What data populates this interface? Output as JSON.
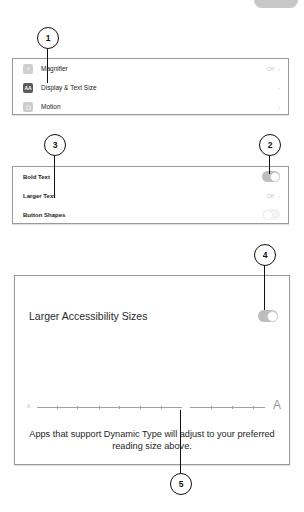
{
  "accessibility_list": {
    "items": [
      {
        "icon": "magnifier-icon",
        "icon_glyph": "⌕",
        "label": "Magnifier",
        "value": "Off",
        "chevron": "›"
      },
      {
        "icon": "display-text-size-icon",
        "icon_glyph": "AA",
        "label": "Display & Text Size",
        "value": "",
        "chevron": "›"
      },
      {
        "icon": "motion-icon",
        "icon_glyph": "▢",
        "label": "Motion",
        "value": "",
        "chevron": "›"
      }
    ]
  },
  "text_settings": {
    "items": [
      {
        "label": "Bold Text",
        "control": "toggle",
        "state": "on"
      },
      {
        "label": "Larger Text",
        "value": "Off",
        "chevron": "›"
      },
      {
        "label": "Button Shapes",
        "control": "toggle",
        "state": "off"
      }
    ]
  },
  "larger_text": {
    "toggle_label": "Larger Accessibility Sizes",
    "toggle_state": "on",
    "slider": {
      "min_glyph": "A",
      "max_glyph": "A",
      "steps": 12,
      "position": 8
    },
    "description": "Apps that support Dynamic Type will adjust to your preferred reading size above."
  },
  "callouts": [
    "1",
    "2",
    "3",
    "4",
    "5"
  ],
  "colors": {
    "toggle_track": "#bdbdbd",
    "panel_border": "#9a9a9a",
    "callout_ink": "#111111"
  }
}
